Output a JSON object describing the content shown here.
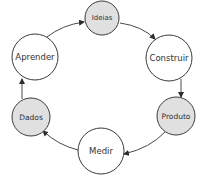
{
  "diagram": {
    "type": "cycle",
    "colors": {
      "highlight_fill": "#e0e0e0",
      "plain_fill": "#ffffff",
      "stroke": "#3a3a3a",
      "text": "#333333"
    },
    "nodes": [
      {
        "id": "ideias",
        "label": "Ideias",
        "cx": 102,
        "cy": 18,
        "r": 17,
        "highlighted": true,
        "font_size": 7
      },
      {
        "id": "construir",
        "label": "Construir",
        "cx": 169,
        "cy": 58,
        "r": 23,
        "highlighted": false,
        "font_size": 8.5
      },
      {
        "id": "produto",
        "label": "Produto",
        "cx": 176,
        "cy": 116,
        "r": 19,
        "highlighted": true,
        "font_size": 7.5
      },
      {
        "id": "medir",
        "label": "Medir",
        "cx": 101,
        "cy": 151,
        "r": 23,
        "highlighted": false,
        "font_size": 8.5
      },
      {
        "id": "dados",
        "label": "Dados",
        "cx": 31,
        "cy": 117,
        "r": 19,
        "highlighted": true,
        "font_size": 7.5
      },
      {
        "id": "aprender",
        "label": "Aprender",
        "cx": 35,
        "cy": 57,
        "r": 23,
        "highlighted": false,
        "font_size": 8.5
      }
    ],
    "edges": [
      {
        "from": "ideias",
        "to": "construir",
        "path": "M120,23 Q142,26 155,39"
      },
      {
        "from": "construir",
        "to": "produto",
        "path": "M181,79 L181,97"
      },
      {
        "from": "produto",
        "to": "medir",
        "path": "M165,132 Q150,148 124,154"
      },
      {
        "from": "medir",
        "to": "dados",
        "path": "M78,150 Q58,145 43,131"
      },
      {
        "from": "dados",
        "to": "aprender",
        "path": "M22,99 L22,79"
      },
      {
        "from": "aprender",
        "to": "ideias",
        "path": "M47,37 Q62,25 84,22"
      }
    ]
  }
}
